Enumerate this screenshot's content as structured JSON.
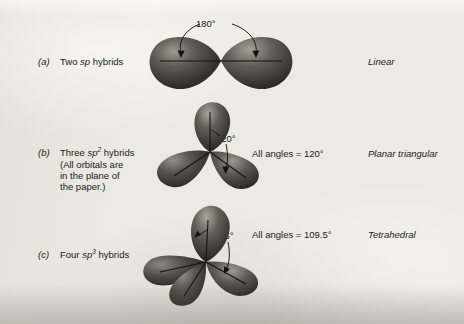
{
  "figure": {
    "caption_rows": [
      {
        "marker": "(a)",
        "label_lines": [
          "Two sp hybrids"
        ],
        "label_html_parts": [
          {
            "text": "Two ",
            "italic": false
          },
          {
            "text": "sp",
            "italic": true
          },
          {
            "text": " hybrids",
            "italic": false
          }
        ],
        "angle_annotation": "180°",
        "all_angles_text": "",
        "geometry_name": "Linear",
        "orbital_count": 2,
        "hybrid": "sp",
        "superscript": ""
      },
      {
        "marker": "(b)",
        "label_lines": [
          "Three sp2 hybrids",
          "(All orbitals are",
          "in the plane of",
          "the paper.)"
        ],
        "angle_annotation": "120°",
        "all_angles_text": "All angles = 120°",
        "geometry_name": "Planar triangular",
        "orbital_count": 3,
        "hybrid": "sp",
        "superscript": "2"
      },
      {
        "marker": "(c)",
        "label_lines": [
          "Four sp3 hybrids"
        ],
        "angle_annotation": "109.5°",
        "all_angles_text": "All angles = 109.5°",
        "geometry_name": "Tetrahedral",
        "orbital_count": 4,
        "hybrid": "sp",
        "superscript": "3"
      }
    ],
    "text_fragments": {
      "two": "Two ",
      "three": "Three ",
      "four": "Four ",
      "sp": "sp",
      "hybrids": " hybrids",
      "note_line_1": "(All orbitals are",
      "note_line_2": "in the plane of",
      "note_line_3": "the paper.)"
    },
    "colors": {
      "paper": "#eceae4",
      "ink": "#1b1b1b",
      "orbital_dark": "#2c2a27",
      "orbital_mid": "#55514c",
      "orbital_light": "#9b958c"
    }
  }
}
